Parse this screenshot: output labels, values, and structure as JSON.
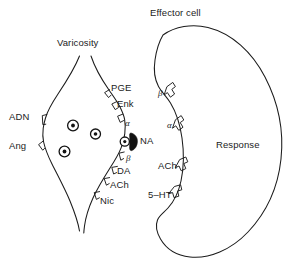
{
  "figure": {
    "title_varicosity": "Varicosity",
    "title_effector": "Effector cell",
    "response_label": "Response",
    "background_color": "#ffffff",
    "ink_color": "#1b1b1b"
  },
  "varicosity": {
    "name": "Varicosity",
    "transmitter_label": "NA",
    "prejunctional_receptors_left": [
      {
        "label": "ADN"
      },
      {
        "label": "Ang"
      }
    ],
    "prejunctional_receptors_right": [
      {
        "label": "PGE"
      },
      {
        "label": "Enk"
      },
      {
        "label": "α"
      },
      {
        "label": "β"
      },
      {
        "label": "DA"
      },
      {
        "label": "ACh"
      },
      {
        "label": "Nic"
      }
    ],
    "vesicle_count": 4
  },
  "effector_cell": {
    "name": "Effector cell",
    "response": "Response",
    "postjunctional_receptors": [
      {
        "label": "β"
      },
      {
        "label": "α"
      },
      {
        "label": "ACh"
      },
      {
        "label": "5–HT"
      }
    ]
  }
}
